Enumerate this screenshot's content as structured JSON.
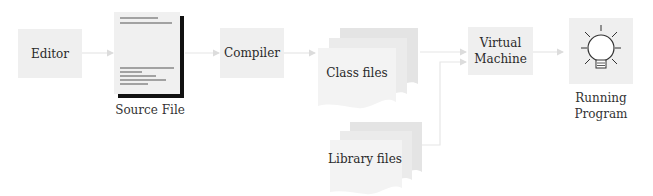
{
  "diagram": {
    "nodes": {
      "editor": {
        "label": "Editor"
      },
      "source_file": {
        "label": "Source File"
      },
      "compiler": {
        "label": "Compiler"
      },
      "class_files": {
        "label": "Class files"
      },
      "library_files": {
        "label": "Library files"
      },
      "virtual_machine": {
        "label_line1": "Virtual",
        "label_line2": "Machine"
      },
      "running_program": {
        "label_line1": "Running",
        "label_line2": "Program",
        "icon": "lightbulb-icon"
      }
    },
    "edges": [
      {
        "from": "Editor",
        "to": "Source File"
      },
      {
        "from": "Source File",
        "to": "Compiler"
      },
      {
        "from": "Compiler",
        "to": "Class files"
      },
      {
        "from": "Class files",
        "to": "Virtual Machine"
      },
      {
        "from": "Library files",
        "to": "Virtual Machine"
      },
      {
        "from": "Virtual Machine",
        "to": "Running Program"
      }
    ],
    "colors": {
      "box_fill": "#efefef",
      "arrow": "#e2e2e2",
      "stack_back": "#e4e4e4",
      "stack_mid": "#ebebeb",
      "stack_front": "#f3f3f3",
      "doc_shadow": "#111111"
    }
  }
}
